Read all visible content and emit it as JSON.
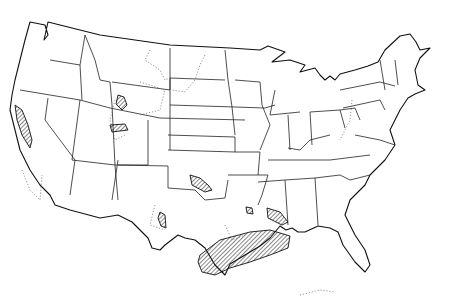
{
  "map": {
    "subject": "Contiguous United States outline map with state boundaries",
    "background_color": "#ffffff",
    "line_color": "#111111",
    "legend": null,
    "features": {
      "hatched_regions": [
        {
          "name": "california-coast-range",
          "style": "diagonal-hatch"
        },
        {
          "name": "wyoming-wind-river",
          "style": "diagonal-hatch"
        },
        {
          "name": "utah-uinta",
          "style": "diagonal-hatch"
        },
        {
          "name": "oklahoma-anadarko",
          "style": "diagonal-hatch"
        },
        {
          "name": "west-texas-permian",
          "style": "diagonal-hatch"
        },
        {
          "name": "gulf-coast-texas-louisiana",
          "style": "diagonal-hatch"
        },
        {
          "name": "north-louisiana",
          "style": "diagonal-hatch"
        },
        {
          "name": "mississippi-south",
          "style": "diagonal-hatch"
        }
      ],
      "dotted_outlines": [
        "montana-dakota-williston",
        "wyoming-basins",
        "utah-colorado-plateau",
        "appalachian",
        "southern-california",
        "gulf-offshore"
      ]
    }
  }
}
